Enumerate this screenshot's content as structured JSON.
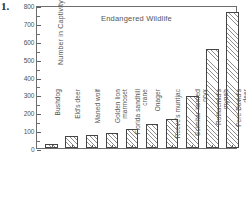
{
  "figure": {
    "item_number": "1."
  },
  "chart_data": {
    "type": "bar",
    "title": "Endangered Wildlife",
    "xlabel": "",
    "ylabel": "Number in Captivity",
    "ylim": [
      0,
      800
    ],
    "ytick_step": 100,
    "yminor_step": 50,
    "grid": false,
    "legend": null,
    "categories": [
      "Bushdog",
      "Eld's deer",
      "Maned wolf",
      "Golden lion marmoset",
      "Florida sandhill crane",
      "Onager",
      "Reeve's muntjac",
      "Scimitar horned oryx",
      "Rothschild's mynah",
      "Pere David's deer"
    ],
    "category_lines": [
      [
        "Bushdog"
      ],
      [
        "Eld's deer"
      ],
      [
        "Maned wolf"
      ],
      [
        "Golden lion",
        "marmoset"
      ],
      [
        "Florida sandhill",
        "crane"
      ],
      [
        "Onager"
      ],
      [
        "Reeve's muntjac"
      ],
      [
        "Scimitar horned",
        "oryx"
      ],
      [
        "Rothschild's",
        "mynah"
      ],
      [
        "Pere David's",
        "deer"
      ]
    ],
    "values": [
      22,
      65,
      75,
      82,
      105,
      135,
      160,
      290,
      555,
      760
    ],
    "ytick_labels": [
      "0",
      "100",
      "200",
      "300",
      "400",
      "500",
      "600",
      "700",
      "800"
    ],
    "bar_fill": "#ffffff",
    "bar_edge": "#444444",
    "bar_hatch": "forward-diagonal",
    "axis_color": "#6d6d6d",
    "text_color": "#555555"
  }
}
